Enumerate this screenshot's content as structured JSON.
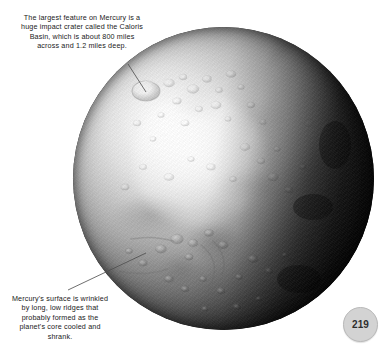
{
  "page": {
    "background_color": "#ffffff",
    "page_number": "219",
    "page_number_badge_color": "#d3d3d3",
    "text_color": "#1a1a1a"
  },
  "figure": {
    "subject": "Mercury",
    "type": "photograph-illustration",
    "disc_color_light": "#ffffff",
    "disc_color_dark": "#0e0e0e"
  },
  "callouts": [
    {
      "id": "caloris-basin",
      "text": "The largest feature on Mercury is a huge impact crater called the Caloris Basin, which is about 800 miles across and 1.2 miles deep.",
      "leader_from": [
        128,
        64
      ],
      "leader_to": [
        146,
        92
      ]
    },
    {
      "id": "wrinkle-ridges",
      "text": "Mercury's surface is wrinkled by long, low ridges that probably formed as the planet's core cooled and shrank.",
      "leader_from": [
        68,
        290
      ],
      "leader_to": [
        146,
        253
      ]
    }
  ]
}
